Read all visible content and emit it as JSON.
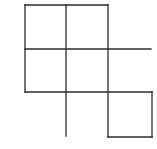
{
  "diagram": {
    "type": "grid-of-squares",
    "stroke_color": "#2b2b2b",
    "background": "#ffffff",
    "segments": [
      {
        "x1": 25,
        "y1": 5,
        "x2": 108,
        "y2": 5
      },
      {
        "x1": 25,
        "y1": 49,
        "x2": 151,
        "y2": 49
      },
      {
        "x1": 25,
        "y1": 92,
        "x2": 152,
        "y2": 92
      },
      {
        "x1": 108,
        "y1": 137,
        "x2": 152,
        "y2": 137
      },
      {
        "x1": 25,
        "y1": 5,
        "x2": 25,
        "y2": 92
      },
      {
        "x1": 66,
        "y1": 5,
        "x2": 66,
        "y2": 136
      },
      {
        "x1": 108,
        "y1": 5,
        "x2": 108,
        "y2": 137
      },
      {
        "x1": 152,
        "y1": 92,
        "x2": 152,
        "y2": 137
      }
    ]
  }
}
